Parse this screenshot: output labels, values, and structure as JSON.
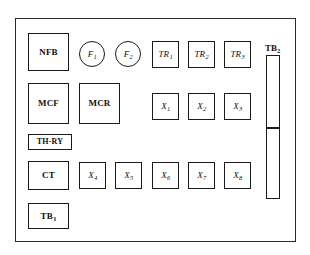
{
  "diagram": {
    "background_color": "#ffffff",
    "line_color": "#1a1a1a",
    "enclosure": {
      "name": "panel-enclosure",
      "x": 15,
      "y": 18,
      "width": 281,
      "height": 224
    },
    "components": [
      {
        "id": "nfb",
        "label": "NFB",
        "sub": "",
        "shape": "rect",
        "style": "roman",
        "x": 28,
        "y": 33,
        "width": 41,
        "height": 38
      },
      {
        "id": "f1",
        "label": "F",
        "sub": "1",
        "shape": "circle",
        "style": "italic",
        "x": 79,
        "y": 41,
        "width": 26,
        "height": 26
      },
      {
        "id": "f2",
        "label": "F",
        "sub": "2",
        "shape": "circle",
        "style": "italic",
        "x": 115,
        "y": 41,
        "width": 26,
        "height": 26
      },
      {
        "id": "tr1",
        "label": "TR",
        "sub": "1",
        "shape": "rect",
        "style": "italic",
        "x": 152,
        "y": 41,
        "width": 27,
        "height": 27
      },
      {
        "id": "tr2",
        "label": "TR",
        "sub": "2",
        "shape": "rect",
        "style": "italic",
        "x": 188,
        "y": 41,
        "width": 27,
        "height": 27
      },
      {
        "id": "tr3",
        "label": "TR",
        "sub": "3",
        "shape": "rect",
        "style": "italic",
        "x": 224,
        "y": 41,
        "width": 27,
        "height": 27
      },
      {
        "id": "mcf",
        "label": "MCF",
        "sub": "",
        "shape": "rect",
        "style": "roman",
        "x": 28,
        "y": 83,
        "width": 41,
        "height": 41
      },
      {
        "id": "mcr",
        "label": "MCR",
        "sub": "",
        "shape": "rect",
        "style": "roman",
        "x": 79,
        "y": 83,
        "width": 41,
        "height": 41
      },
      {
        "id": "x1",
        "label": "X",
        "sub": "1",
        "shape": "rect",
        "style": "italic",
        "x": 152,
        "y": 93,
        "width": 27,
        "height": 27
      },
      {
        "id": "x2",
        "label": "X",
        "sub": "2",
        "shape": "rect",
        "style": "italic",
        "x": 188,
        "y": 93,
        "width": 27,
        "height": 27
      },
      {
        "id": "x3",
        "label": "X",
        "sub": "3",
        "shape": "rect",
        "style": "italic",
        "x": 224,
        "y": 93,
        "width": 27,
        "height": 27
      },
      {
        "id": "thry",
        "label": "TH-RY",
        "sub": "",
        "shape": "rect",
        "style": "roman",
        "x": 28,
        "y": 134,
        "width": 44,
        "height": 16
      },
      {
        "id": "ct",
        "label": "CT",
        "sub": "",
        "shape": "rect",
        "style": "roman",
        "x": 28,
        "y": 161,
        "width": 41,
        "height": 29
      },
      {
        "id": "x4",
        "label": "X",
        "sub": "4",
        "shape": "rect",
        "style": "italic",
        "x": 79,
        "y": 162,
        "width": 27,
        "height": 27
      },
      {
        "id": "x5",
        "label": "X",
        "sub": "5",
        "shape": "rect",
        "style": "italic",
        "x": 115,
        "y": 162,
        "width": 27,
        "height": 27
      },
      {
        "id": "x6",
        "label": "X",
        "sub": "6",
        "shape": "rect",
        "style": "italic",
        "x": 152,
        "y": 162,
        "width": 27,
        "height": 27
      },
      {
        "id": "x7",
        "label": "X",
        "sub": "7",
        "shape": "rect",
        "style": "italic",
        "x": 188,
        "y": 162,
        "width": 27,
        "height": 27
      },
      {
        "id": "x8",
        "label": "X",
        "sub": "8",
        "shape": "rect",
        "style": "italic",
        "x": 224,
        "y": 162,
        "width": 27,
        "height": 27
      },
      {
        "id": "tb1",
        "label": "TB",
        "sub": "1",
        "shape": "rect",
        "style": "roman",
        "x": 28,
        "y": 203,
        "width": 41,
        "height": 26
      }
    ],
    "terminal_strip": {
      "id": "tb2",
      "label": "TB",
      "sub": "2",
      "label_x": 265,
      "label_y": 44,
      "segments": [
        {
          "id": "tb2-upper",
          "x": 266,
          "y": 55,
          "width": 14,
          "height": 73
        },
        {
          "id": "tb2-lower",
          "x": 266,
          "y": 128,
          "width": 14,
          "height": 71
        }
      ]
    }
  }
}
